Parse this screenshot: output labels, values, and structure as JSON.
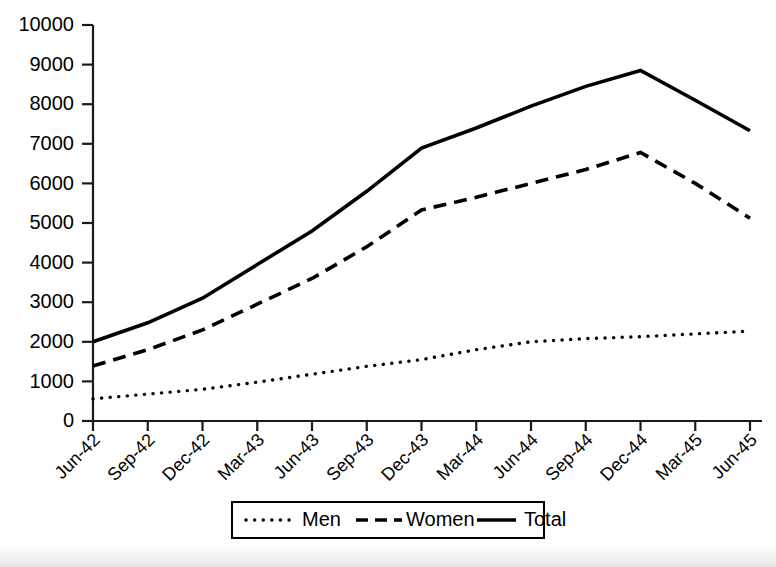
{
  "chart_data": {
    "type": "line",
    "title": "",
    "subtitle": "",
    "xlabel": "",
    "ylabel": "",
    "categories": [
      "Jun-42",
      "Sep-42",
      "Dec-42",
      "Mar-43",
      "Jun-43",
      "Sep-43",
      "Dec-43",
      "Mar-44",
      "Jun-44",
      "Sep-44",
      "Dec-44",
      "Mar-45",
      "Jun-45"
    ],
    "series": [
      {
        "name": "Men",
        "style": "dotted",
        "color": "#000000",
        "values": [
          560,
          680,
          800,
          980,
          1180,
          1380,
          1550,
          1800,
          2000,
          2080,
          2130,
          2200,
          2270
        ]
      },
      {
        "name": "Women",
        "style": "dashed",
        "color": "#000000",
        "values": [
          1390,
          1800,
          2300,
          2950,
          3600,
          4400,
          5330,
          5650,
          6000,
          6350,
          6780,
          6000,
          5120
        ]
      },
      {
        "name": "Total",
        "style": "solid",
        "color": "#000000",
        "values": [
          2000,
          2480,
          3100,
          3950,
          4800,
          5800,
          6890,
          7400,
          7950,
          8450,
          8850,
          8100,
          7330
        ]
      }
    ],
    "ylim": [
      0,
      10000
    ],
    "ytick_values": [
      0,
      1000,
      2000,
      3000,
      4000,
      5000,
      6000,
      7000,
      8000,
      9000,
      10000
    ],
    "ytick_labels": [
      "0",
      "1000",
      "2000",
      "3000",
      "4000",
      "5000",
      "6000",
      "7000",
      "8000",
      "9000",
      "10000"
    ],
    "grid": false,
    "legend_position": "bottom",
    "legend_entries": [
      "Men",
      "Women",
      "Total"
    ],
    "xtick_rotation_degrees": 45,
    "annotations": []
  },
  "legend": {
    "men_label": "Men",
    "women_label": "Women",
    "total_label": "Total"
  }
}
